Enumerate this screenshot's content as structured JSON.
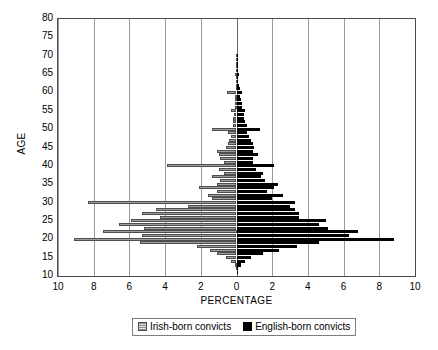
{
  "chart_data": {
    "type": "bar",
    "subtype": "population-pyramid",
    "title": "",
    "xlabel": "PERCENTAGE",
    "ylabel": "AGE",
    "orientation": "horizontal",
    "grid": true,
    "legend_position": "bottom",
    "xlim": [
      -10,
      10
    ],
    "ylim": [
      10,
      80
    ],
    "xticks": [
      -10,
      -8,
      -6,
      -4,
      -2,
      0,
      2,
      4,
      6,
      8,
      10
    ],
    "xtick_labels": [
      "10",
      "8",
      "6",
      "4",
      "2",
      "0",
      "2",
      "4",
      "6",
      "8",
      "10"
    ],
    "yticks": [
      10,
      15,
      20,
      25,
      30,
      35,
      40,
      45,
      50,
      55,
      60,
      65,
      70,
      75,
      80
    ],
    "ytick_labels": [
      "10",
      "15",
      "20",
      "25",
      "30",
      "35",
      "40",
      "45",
      "50",
      "55",
      "60",
      "65",
      "70",
      "75",
      "80"
    ],
    "categories": [
      11,
      12,
      13,
      14,
      15,
      16,
      17,
      18,
      19,
      20,
      21,
      22,
      23,
      24,
      25,
      26,
      27,
      28,
      29,
      30,
      31,
      32,
      33,
      34,
      35,
      36,
      37,
      38,
      39,
      40,
      41,
      42,
      43,
      44,
      45,
      46,
      47,
      48,
      49,
      50,
      51,
      52,
      53,
      54,
      55,
      56,
      57,
      58,
      59,
      60,
      61,
      62,
      63,
      64,
      65,
      66,
      67,
      68,
      69,
      70
    ],
    "series": [
      {
        "name": "Irish-born convicts",
        "side": "left",
        "color": "#c6c6c6",
        "pattern": "horizontal-hatch",
        "values": [
          0.0,
          0.05,
          0.1,
          0.3,
          0.6,
          1.1,
          1.5,
          2.2,
          5.4,
          9.1,
          5.3,
          7.5,
          5.2,
          6.6,
          5.9,
          4.3,
          5.3,
          4.5,
          2.7,
          8.3,
          1.4,
          1.6,
          1.1,
          2.1,
          1.1,
          0.9,
          1.4,
          0.7,
          1.0,
          3.9,
          0.7,
          0.9,
          1.0,
          1.1,
          0.6,
          0.5,
          0.4,
          0.3,
          0.5,
          1.4,
          0.2,
          0.2,
          0.2,
          0.15,
          0.3,
          0.1,
          0.1,
          0.1,
          0.1,
          0.55,
          0.05,
          0.05,
          0.05,
          0.05,
          0.1,
          0.03,
          0.03,
          0.02,
          0.02,
          0.05
        ]
      },
      {
        "name": "English-born convicts",
        "side": "right",
        "color": "#000000",
        "pattern": "solid",
        "values": [
          0.05,
          0.1,
          0.25,
          0.5,
          0.8,
          1.5,
          2.4,
          3.4,
          4.6,
          8.8,
          6.3,
          6.8,
          5.1,
          4.6,
          5.0,
          3.5,
          3.5,
          3.3,
          3.0,
          3.3,
          2.0,
          2.6,
          1.7,
          2.1,
          2.3,
          1.6,
          1.4,
          1.5,
          1.1,
          2.1,
          0.9,
          0.9,
          1.2,
          0.9,
          1.0,
          0.9,
          0.8,
          0.7,
          0.6,
          1.3,
          0.6,
          0.5,
          0.4,
          0.4,
          0.5,
          0.3,
          0.3,
          0.25,
          0.2,
          0.3,
          0.2,
          0.15,
          0.1,
          0.1,
          0.12,
          0.08,
          0.06,
          0.05,
          0.04,
          0.06
        ]
      }
    ]
  },
  "legend": {
    "items": [
      {
        "label": "Irish-born convicts",
        "swatch": "irish-swatch"
      },
      {
        "label": "English-born convicts",
        "swatch": "english-swatch"
      }
    ]
  }
}
